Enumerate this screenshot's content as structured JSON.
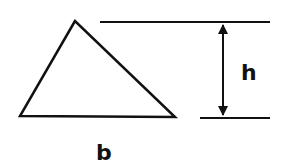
{
  "diagram": {
    "title": "",
    "labels": {
      "height": "h",
      "base": "b"
    },
    "colors": {
      "stroke": "#111111",
      "background": "#ffffff"
    },
    "shapes": {
      "triangle": {
        "points": [
          [
            75,
            21
          ],
          [
            20,
            116
          ],
          [
            175,
            117
          ]
        ]
      },
      "top_reference_line": {
        "x1": 100,
        "y1": 22,
        "x2": 270,
        "y2": 22
      },
      "bottom_reference_line": {
        "x1": 200,
        "y1": 118,
        "x2": 270,
        "y2": 118
      },
      "height_arrow": {
        "x": 223,
        "y1": 22,
        "y2": 118
      }
    }
  }
}
